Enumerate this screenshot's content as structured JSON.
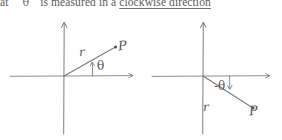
{
  "page": {
    "width": 282,
    "height": 140,
    "background": "#ffffff",
    "ink_color": "#555555"
  },
  "caption": {
    "fragment_1": "at",
    "theta_symbol": "θ",
    "fragment_2": "is measured in a",
    "underlined_phrase": "clockwise direction",
    "full_text": "at θ is measured in a clockwise direction"
  },
  "diagrams": [
    {
      "id": "diagram-left",
      "name": "positive-angle-diagram",
      "description": "Cartesian axes with ray r from origin into the first quadrant, angle theta measured counter-clockwise from the positive x-axis, endpoint labelled P",
      "origin": {
        "x": 64,
        "y": 76
      },
      "axes": {
        "x_axis": {
          "x1": 10,
          "y1": 76,
          "x2": 133,
          "y2": 76,
          "arrow": "right"
        },
        "y_axis": {
          "x1": 64,
          "y1": 134,
          "x2": 64,
          "y2": 22,
          "arrow": "up"
        }
      },
      "ray": {
        "x1": 64,
        "y1": 76,
        "x2": 116,
        "y2": 47
      },
      "point": {
        "x": 116,
        "y": 47,
        "label": "P"
      },
      "ray_label": "r",
      "angle_label": "θ",
      "angle_sign": "positive",
      "angle_direction": "counter-clockwise"
    },
    {
      "id": "diagram-right",
      "name": "negative-angle-diagram",
      "description": "Cartesian axes with ray r from origin into the fourth quadrant, angle minus theta measured clockwise from the positive x-axis, endpoint labelled P",
      "origin": {
        "x": 62,
        "y": 76
      },
      "axes": {
        "x_axis": {
          "x1": 11,
          "y1": 76,
          "x2": 129,
          "y2": 76,
          "arrow": "right"
        },
        "y_axis": {
          "x1": 62,
          "y1": 134,
          "x2": 62,
          "y2": 22,
          "arrow": "up"
        }
      },
      "ray": {
        "x1": 62,
        "y1": 76,
        "x2": 112,
        "y2": 108
      },
      "point": {
        "x": 112,
        "y": 108,
        "label": "P"
      },
      "ray_label": "r",
      "angle_label": "-θ",
      "angle_sign": "negative",
      "angle_direction": "clockwise"
    }
  ]
}
